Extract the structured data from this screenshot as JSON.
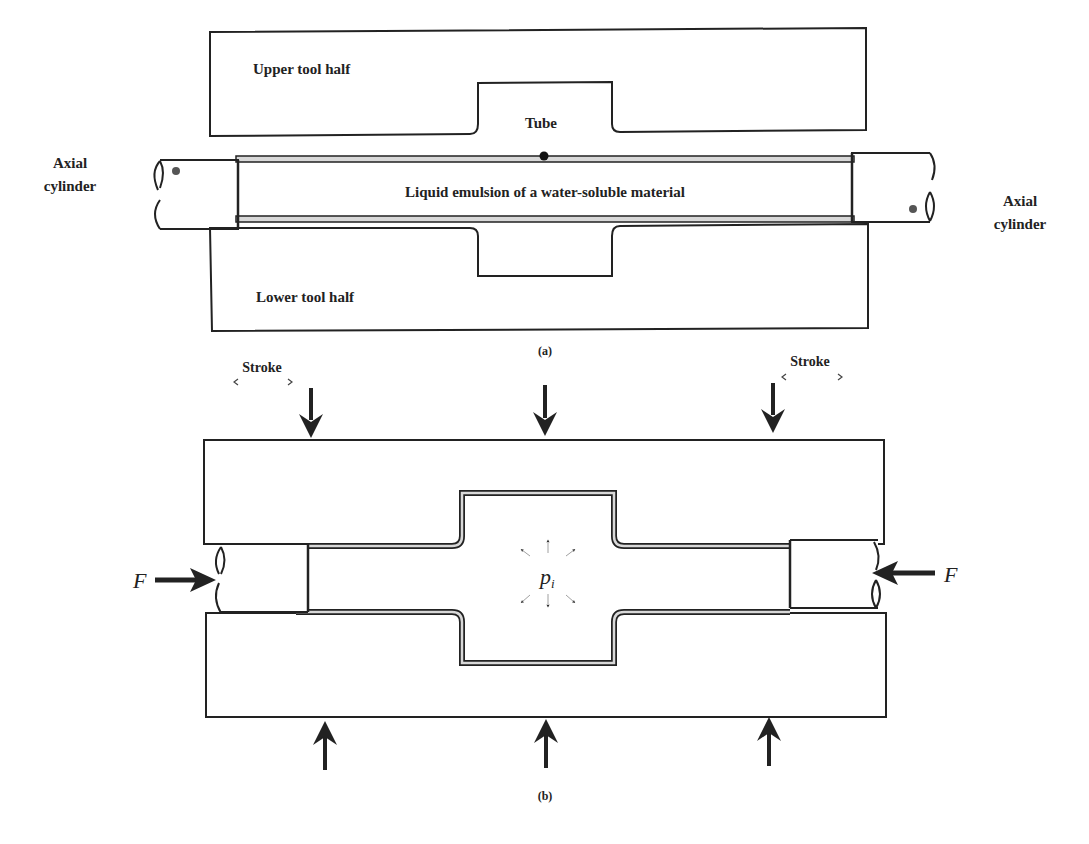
{
  "figure": {
    "panel_a": {
      "caption": "(a)",
      "labels": {
        "upper_tool_half": "Upper tool half",
        "lower_tool_half": "Lower tool half",
        "tube": "Tube",
        "liquid": "Liquid emulsion of a water-soluble material",
        "axial_left_line1": "Axial",
        "axial_left_line2": "cylinder",
        "axial_right_line1": "Axial",
        "axial_right_line2": "cylinder"
      }
    },
    "panel_b": {
      "caption": "(b)",
      "labels": {
        "stroke_left": "Stroke",
        "stroke_right": "Stroke",
        "force_left": "F",
        "force_right": "F",
        "pressure_symbol": "p",
        "pressure_subscript": "i"
      }
    },
    "colors": {
      "line": "#222222",
      "background": "#ffffff",
      "tube_wall_fill": "#d8d8d8"
    }
  }
}
